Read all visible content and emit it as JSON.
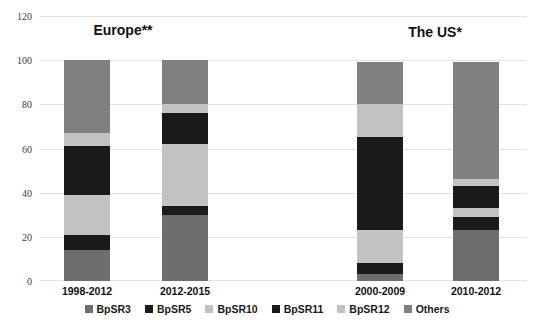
{
  "chart_data": {
    "type": "bar",
    "subtype": "stacked-column",
    "title": "",
    "xlabel": "",
    "ylabel": "",
    "ylim": [
      0,
      120
    ],
    "yticks": [
      0,
      20,
      40,
      60,
      80,
      100,
      120
    ],
    "grid": true,
    "legend_position": "bottom",
    "categories": [
      "1998-2012",
      "2012-2015",
      "2000-2009",
      "2010-2012"
    ],
    "groups": [
      {
        "title": "Europe**",
        "categories": [
          "1998-2012",
          "2012-2015"
        ]
      },
      {
        "title": "The US*",
        "categories": [
          "2000-2009",
          "2010-2012"
        ]
      }
    ],
    "series": [
      {
        "name": "BpSR3",
        "color": "#6e6e6e",
        "values": [
          14,
          30,
          3,
          23
        ]
      },
      {
        "name": "BpSR5",
        "color": "#1a1a1a",
        "values": [
          7,
          4,
          5,
          6
        ]
      },
      {
        "name": "BpSR10",
        "color": "#c2c2c2",
        "values": [
          18,
          28,
          15,
          4
        ]
      },
      {
        "name": "BpSR11",
        "color": "#1a1a1a",
        "values": [
          22,
          14,
          42,
          10
        ]
      },
      {
        "name": "BpSR12",
        "color": "#c2c2c2",
        "values": [
          6,
          4,
          15,
          3
        ]
      },
      {
        "name": "Others",
        "color": "#808080",
        "values": [
          33,
          20,
          19,
          53
        ]
      }
    ],
    "totals": [
      100,
      100,
      99,
      99
    ],
    "caption": ""
  },
  "axis": {
    "tick_120": "120",
    "tick_100": "100",
    "tick_80": "80",
    "tick_60": "60",
    "tick_40": "40",
    "tick_20": "20",
    "tick_0": "0"
  }
}
